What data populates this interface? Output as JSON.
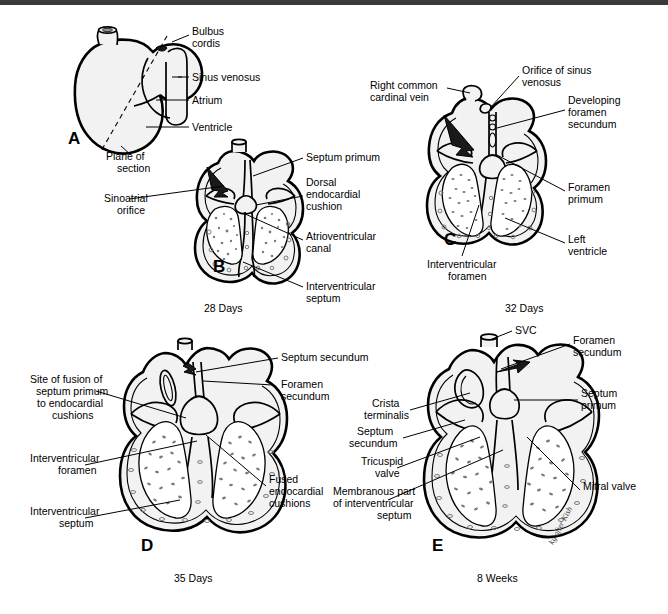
{
  "figure": {
    "type": "medical-illustration",
    "signature": "kg after Kish"
  },
  "panels": [
    {
      "id": "A",
      "letter": "A",
      "view": "external view of primitive heart tube with plane of section",
      "stage": "",
      "labels": [
        {
          "text": "Bulbus cordis",
          "lines": [
            "Bulbus",
            "cordis"
          ]
        },
        {
          "text": "Sinus venosus",
          "lines": [
            "Sinus venosus"
          ]
        },
        {
          "text": "Atrium",
          "lines": [
            "Atrium"
          ]
        },
        {
          "text": "Ventricle",
          "lines": [
            "Ventricle"
          ]
        },
        {
          "text": "Plane of section",
          "lines": [
            "Plane of",
            "section"
          ]
        }
      ]
    },
    {
      "id": "B",
      "letter": "B",
      "view": "coronal section",
      "stage": "28 Days",
      "labels": [
        {
          "text": "Sinoatrial orifice",
          "lines": [
            "Sinoatrial",
            "orifice"
          ]
        },
        {
          "text": "Septum primum",
          "lines": [
            "Septum primum"
          ]
        },
        {
          "text": "Dorsal endocardial cushion",
          "lines": [
            "Dorsal",
            "endocardial",
            "cushion"
          ]
        },
        {
          "text": "Atrioventricular canal",
          "lines": [
            "Atrioventricular",
            "canal"
          ]
        },
        {
          "text": "Interventricular septum",
          "lines": [
            "Interventricular",
            "septum"
          ]
        }
      ]
    },
    {
      "id": "C",
      "letter": "C",
      "view": "coronal section",
      "stage": "32 Days",
      "labels": [
        {
          "text": "Right common cardinal vein",
          "lines": [
            "Right common",
            "cardinal vein"
          ]
        },
        {
          "text": "Orifice of sinus venosus",
          "lines": [
            "Orifice of sinus",
            "venosus"
          ]
        },
        {
          "text": "Developing foramen secundum",
          "lines": [
            "Developing",
            "foramen",
            "secundum"
          ]
        },
        {
          "text": "Foramen primum",
          "lines": [
            "Foramen",
            "primum"
          ]
        },
        {
          "text": "Left ventricle",
          "lines": [
            "Left",
            "ventricle"
          ]
        },
        {
          "text": "Interventricular foramen",
          "lines": [
            "Interventricular",
            "foramen"
          ]
        }
      ]
    },
    {
      "id": "D",
      "letter": "D",
      "view": "coronal section",
      "stage": "35 Days",
      "labels": [
        {
          "text": "Site of fusion of septum primum to endocardial cushions",
          "lines": [
            "Site of fusion of",
            "septum primum",
            "to endocardial",
            "cushions"
          ]
        },
        {
          "text": "Interventricular foramen",
          "lines": [
            "Interventricular",
            "foramen"
          ]
        },
        {
          "text": "Interventricular septum",
          "lines": [
            "Interventricular",
            "septum"
          ]
        },
        {
          "text": "Septum secundum",
          "lines": [
            "Septum secundum"
          ]
        },
        {
          "text": "Foramen secundum",
          "lines": [
            "Foramen",
            "secundum"
          ]
        },
        {
          "text": "Fused endocardial cushions",
          "lines": [
            "Fused",
            "endocardial",
            "cushions"
          ]
        }
      ]
    },
    {
      "id": "E",
      "letter": "E",
      "view": "coronal section",
      "stage": "8 Weeks",
      "labels": [
        {
          "text": "SVC",
          "lines": [
            "SVC"
          ]
        },
        {
          "text": "Foramen secundum",
          "lines": [
            "Foramen",
            "secundum"
          ]
        },
        {
          "text": "Septum primum",
          "lines": [
            "Septum",
            "primum"
          ]
        },
        {
          "text": "Crista terminalis",
          "lines": [
            "Crista",
            "terminalis"
          ]
        },
        {
          "text": "Septum secundum",
          "lines": [
            "Septum",
            "secundum"
          ]
        },
        {
          "text": "Tricuspid valve",
          "lines": [
            "Tricuspid",
            "valve"
          ]
        },
        {
          "text": "Membranous part of interventricular septum",
          "lines": [
            "Membranous part",
            "of interventricular",
            "septum"
          ]
        },
        {
          "text": "Mitral valve",
          "lines": [
            "Mitral valve"
          ]
        }
      ]
    }
  ],
  "stages": {
    "b": "28 Days",
    "c": "32 Days",
    "d": "35 Days",
    "e": "8 Weeks"
  },
  "colors": {
    "ink": "#000000",
    "tissue_fill": "#f2f2f2",
    "speckle": "#7a7a7a",
    "topbar": "#3a3a3a",
    "background": "#ffffff"
  }
}
